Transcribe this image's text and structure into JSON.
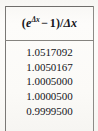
{
  "table": {
    "header": {
      "formula_text": "(e^Δx − 1)/Δx",
      "open_paren": "(",
      "base": "e",
      "exponent": "Δx",
      "minus": "−",
      "one": "1",
      "close_paren": ")",
      "slash": "/",
      "denominator": "Δx"
    },
    "values": [
      "1.0517092",
      "1.0050167",
      "1.0005000",
      "1.0000500",
      "0.9999500"
    ]
  },
  "chart_data": {
    "type": "table",
    "columns": [
      "(e^Δx − 1)/Δx"
    ],
    "rows": [
      [
        "1.0517092"
      ],
      [
        "1.0050167"
      ],
      [
        "1.0005000"
      ],
      [
        "1.0000500"
      ],
      [
        "0.9999500"
      ]
    ],
    "values": [
      1.0517092,
      1.0050167,
      1.0005,
      1.00005,
      0.99995
    ],
    "xlabel": "",
    "ylabel": "",
    "grid": false
  },
  "style": {
    "paper": "#fbfaf8",
    "ink": "#15151a",
    "rule": "#7a7875"
  }
}
